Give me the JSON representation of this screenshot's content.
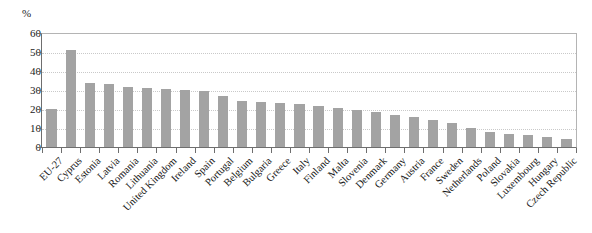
{
  "chart_data": {
    "type": "bar",
    "title": "",
    "subtitle": "",
    "unit_label": "%",
    "xlabel": "",
    "ylabel": "",
    "ylim": [
      0,
      60
    ],
    "yticks": [
      0,
      10,
      20,
      30,
      40,
      50,
      60
    ],
    "grid": true,
    "legend": "none",
    "bar_color": "#a3a3a3",
    "axis_color": "#6e6e6e",
    "gridline_color": "#c9c9c9",
    "categories": [
      "EU-27",
      "Cyprus",
      "Estonia",
      "Latvia",
      "Romania",
      "Lithuania",
      "United Kingdom",
      "Ireland",
      "Spain",
      "Portugal",
      "Belgium",
      "Bulgaria",
      "Greece",
      "Italy",
      "Finland",
      "Malta",
      "Slovenia",
      "Denmark",
      "Germany",
      "Austria",
      "France",
      "Sweden",
      "Netherlands",
      "Poland",
      "Slovakia",
      "Luxembourg",
      "Hungary",
      "Czech Republic"
    ],
    "values": [
      20.0,
      51.0,
      33.5,
      33.0,
      31.5,
      31.0,
      30.5,
      30.0,
      29.5,
      27.0,
      24.0,
      23.5,
      23.0,
      22.5,
      21.5,
      20.5,
      19.5,
      18.5,
      17.0,
      16.0,
      14.0,
      12.5,
      10.0,
      8.0,
      7.0,
      6.5,
      5.5,
      4.0
    ]
  }
}
